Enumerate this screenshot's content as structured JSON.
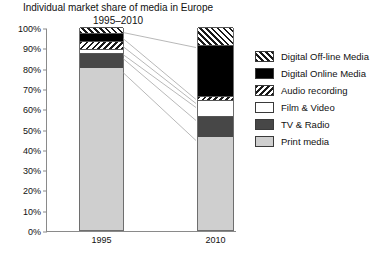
{
  "chart_data": {
    "type": "bar",
    "title": "Individual market share of media in Europe",
    "subtitle": "1995–2010",
    "xlabel": "",
    "ylabel": "",
    "ylim": [
      0,
      100
    ],
    "grid": false,
    "stacked": true,
    "legend_position": "right",
    "categories": [
      "1995",
      "2010"
    ],
    "ytick_labels": [
      "100%",
      "90%",
      "80%",
      "70%",
      "60%",
      "50%",
      "40%",
      "30%",
      "20%",
      "10%",
      "0%"
    ],
    "ytick_values": [
      100,
      90,
      80,
      70,
      60,
      50,
      40,
      30,
      20,
      10,
      0
    ],
    "series": [
      {
        "name": "Print media",
        "key": "print",
        "values": [
          80,
          46
        ],
        "color": "#cfcfcf",
        "pattern": "solid-light-gray"
      },
      {
        "name": "TV & Radio",
        "key": "tv",
        "values": [
          7,
          10
        ],
        "color": "#474747",
        "pattern": "solid-dark-gray"
      },
      {
        "name": "Film & Video",
        "key": "film",
        "values": [
          2,
          8
        ],
        "color": "#ffffff",
        "pattern": "solid-white"
      },
      {
        "name": "Audio recording",
        "key": "audio",
        "values": [
          4,
          2
        ],
        "color": "#1a1a1a",
        "pattern": "backward-hatch"
      },
      {
        "name": "Digital Online Media",
        "key": "online",
        "values": [
          4,
          25
        ],
        "color": "#000000",
        "pattern": "solid-black"
      },
      {
        "name": "Digital Off-line Media",
        "key": "offline",
        "values": [
          3,
          9
        ],
        "color": "#1a1a1a",
        "pattern": "forward-hatch"
      }
    ],
    "legend_order": [
      "Digital Off-line Media",
      "Digital Online Media",
      "Audio recording",
      "Film & Video",
      "TV & Radio",
      "Print media"
    ]
  }
}
